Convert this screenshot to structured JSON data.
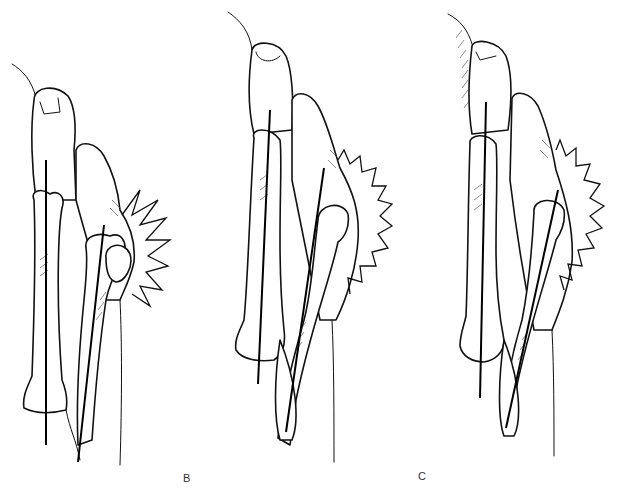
{
  "figure": {
    "panels": [
      {
        "id": "A",
        "label": "",
        "shows_label": false
      },
      {
        "id": "B",
        "label": "B",
        "shows_label": true
      },
      {
        "id": "C",
        "label": "C",
        "shows_label": true
      }
    ],
    "caption": ""
  }
}
